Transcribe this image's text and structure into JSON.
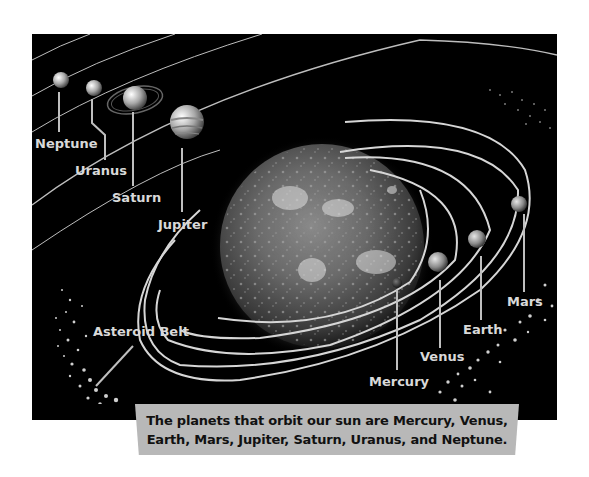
{
  "figure": {
    "background_color": "#000000",
    "orbit_color": "#cfcfcf"
  },
  "sun": {
    "label": "Sun"
  },
  "planets": [
    {
      "name": "Mercury",
      "label": "Mercury"
    },
    {
      "name": "Venus",
      "label": "Venus"
    },
    {
      "name": "Earth",
      "label": "Earth"
    },
    {
      "name": "Mars",
      "label": "Mars"
    },
    {
      "name": "Jupiter",
      "label": "Jupiter"
    },
    {
      "name": "Saturn",
      "label": "Saturn"
    },
    {
      "name": "Uranus",
      "label": "Uranus"
    },
    {
      "name": "Neptune",
      "label": "Neptune"
    }
  ],
  "asteroid_belt": {
    "label": "Asteroid Belt"
  },
  "caption": {
    "line1": "The planets that orbit our sun are Mercury, Venus,",
    "line2": "Earth, Mars, Jupiter, Saturn, Uranus, and Neptune."
  }
}
